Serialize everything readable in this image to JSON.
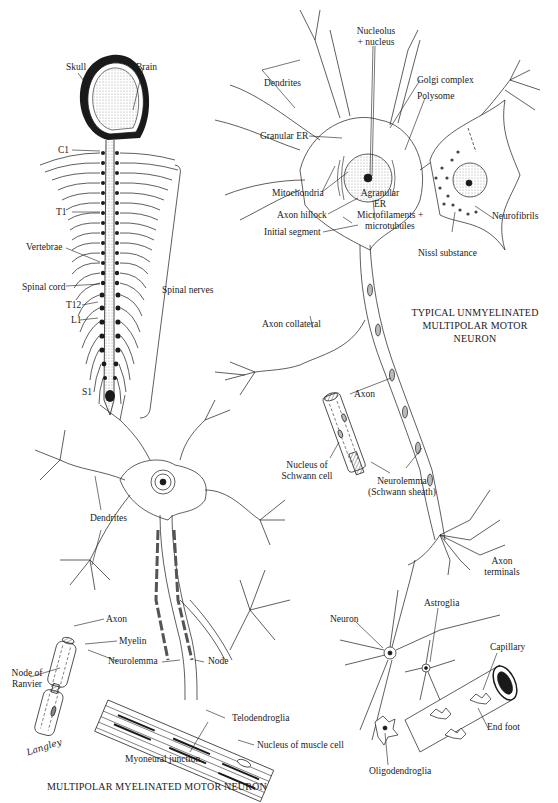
{
  "figure": {
    "panels": [
      {
        "id": "spinal-column",
        "labels": {
          "skull": "Skull",
          "brain": "Brain",
          "c1": "C1",
          "t1": "T1",
          "vertebrae": "Vertebrae",
          "spinal_cord": "Spinal cord",
          "t12": "T12",
          "l1": "L1",
          "s1": "S1",
          "spinal_nerves": "Spinal nerves"
        }
      },
      {
        "id": "unmyelinated-neuron",
        "title_lines": [
          "TYPICAL UNMYELINATED",
          "MULTIPOLAR MOTOR",
          "NEURON"
        ],
        "labels": {
          "nucleolus_line1": "Nucleolus",
          "nucleolus_line2": "+ nucleus",
          "dendrites": "Dendrites",
          "golgi": "Golgi complex",
          "polysome": "Polysome",
          "granular_er": "Granular ER",
          "mitochondria": "Mitochondria",
          "agranular_line1": "Agranular",
          "agranular_line2": "ER",
          "axon_hillock": "Axon hillock",
          "microfilaments_line1": "Microfilaments +",
          "microfilaments_line2": "microtubules",
          "initial_segment": "Initial segment",
          "neurofibrils": "Neurofibrils",
          "nissl": "Nissl substance",
          "axon_collateral": "Axon collateral",
          "axon": "Axon",
          "schwann_nucleus_line1": "Nucleus of",
          "schwann_nucleus_line2": "Schwann cell",
          "neurolemma_line1": "Neurolemma",
          "neurolemma_line2": "(Schwann sheath)",
          "axon_terminals_line1": "Axon",
          "axon_terminals_line2": "terminals"
        }
      },
      {
        "id": "myelinated-neuron",
        "title": "MULTIPOLAR MYELINATED MOTOR NEURON",
        "labels": {
          "dendrites": "Dendrites",
          "axon": "Axon",
          "myelin": "Myelin",
          "neurolemma": "Neurolemma",
          "node": "Node",
          "node_ranvier_line1": "Node of",
          "node_ranvier_line2": "Ranvier",
          "telodendroglia": "Telodendroglia",
          "nucleus_muscle": "Nucleus of muscle cell",
          "myoneural": "Myoneural junction"
        },
        "signature": "Langley"
      },
      {
        "id": "neuroglia",
        "labels": {
          "neuron": "Neuron",
          "astroglia": "Astroglia",
          "capillary": "Capillary",
          "end_foot": "End foot",
          "oligodendroglia": "Oligodendroglia"
        }
      }
    ]
  },
  "colors": {
    "ink": "#1a1a1a",
    "paper": "#ffffff",
    "stipple": "#bdbdbd"
  }
}
